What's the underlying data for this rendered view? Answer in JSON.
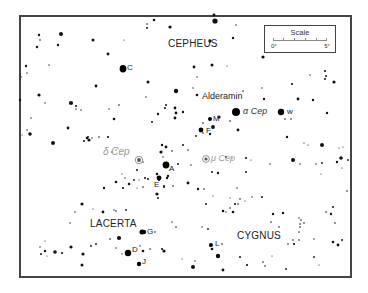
{
  "map": {
    "constellations": [
      {
        "name": "CEPHEUS",
        "x": 168,
        "y": 44
      },
      {
        "name": "LACERTA",
        "x": 90,
        "y": 224
      },
      {
        "name": "CYGNUS",
        "x": 237,
        "y": 236
      }
    ],
    "named_stars": [
      {
        "label": "Alderamin",
        "x": 202,
        "y": 97,
        "style": "plain"
      }
    ],
    "greek_labels": [
      {
        "label": "α Cep",
        "x": 243,
        "y": 107,
        "color": "#333333"
      },
      {
        "label": "δ Cep",
        "x": 103,
        "y": 148,
        "color": "#9a9a9a"
      },
      {
        "label": "μ Cep",
        "x": 210,
        "y": 153,
        "color": "#9a9a9a"
      }
    ],
    "star_letters": [
      {
        "label": "C",
        "x": 127,
        "y": 64
      },
      {
        "label": "w",
        "x": 288,
        "y": 109
      },
      {
        "label": "M",
        "x": 213,
        "y": 116
      },
      {
        "label": "F",
        "x": 207,
        "y": 127
      },
      {
        "label": "A",
        "x": 169,
        "y": 165
      },
      {
        "label": "E",
        "x": 154,
        "y": 181
      },
      {
        "label": "G",
        "x": 148,
        "y": 229
      },
      {
        "label": "D",
        "x": 132,
        "y": 246
      },
      {
        "label": "J",
        "x": 142,
        "y": 259
      },
      {
        "label": "L",
        "x": 215,
        "y": 241
      }
    ],
    "variable_stars": [
      {
        "name": "delta-cep",
        "x": 139,
        "y": 160,
        "r": 2.5,
        "color": "#888888"
      },
      {
        "name": "mu-cep",
        "x": 206,
        "y": 159,
        "r": 2.2,
        "color": "#888888"
      }
    ],
    "scale": {
      "title": "Scale",
      "start_label": "0°",
      "end_label": "5°"
    },
    "stars": [
      [
        214,
        15,
        1.4
      ],
      [
        215,
        21,
        2.6
      ],
      [
        39,
        35,
        1.2
      ],
      [
        40,
        40,
        0.8
      ],
      [
        61,
        34,
        2.0
      ],
      [
        37,
        47,
        1.2
      ],
      [
        93,
        40,
        1.5
      ],
      [
        58,
        45,
        1.2
      ],
      [
        147,
        24,
        0.8
      ],
      [
        147,
        28,
        1.0
      ],
      [
        154,
        20,
        1.3
      ],
      [
        170,
        27,
        1.6
      ],
      [
        108,
        54,
        1.4
      ],
      [
        124,
        40,
        0.6
      ],
      [
        123,
        68,
        3.0
      ],
      [
        26,
        66,
        1.2
      ],
      [
        49,
        65,
        0.7
      ],
      [
        27,
        73,
        0.7
      ],
      [
        21,
        77,
        0.7
      ],
      [
        20,
        100,
        1.2
      ],
      [
        148,
        82,
        1.5
      ],
      [
        96,
        86,
        1.4
      ],
      [
        176,
        91,
        2.2
      ],
      [
        197,
        95,
        1.3
      ],
      [
        193,
        88,
        0.7
      ],
      [
        39,
        95,
        1.6
      ],
      [
        45,
        103,
        0.7
      ],
      [
        71,
        103,
        2.1
      ],
      [
        76,
        106,
        1.0
      ],
      [
        76,
        109,
        0.7
      ],
      [
        81,
        110,
        0.7
      ],
      [
        109,
        109,
        0.7
      ],
      [
        119,
        105,
        0.8
      ],
      [
        114,
        119,
        1.3
      ],
      [
        146,
        97,
        0.7
      ],
      [
        152,
        122,
        1.0
      ],
      [
        158,
        114,
        1.2
      ],
      [
        165,
        108,
        1.0
      ],
      [
        166,
        105,
        1.0
      ],
      [
        175,
        108,
        1.4
      ],
      [
        176,
        113,
        1.4
      ],
      [
        175,
        118,
        1.4
      ],
      [
        183,
        112,
        1.2
      ],
      [
        31,
        118,
        0.7
      ],
      [
        27,
        130,
        0.7
      ],
      [
        30,
        134,
        1.8
      ],
      [
        68,
        128,
        1.4
      ],
      [
        87,
        138,
        1.3
      ],
      [
        88,
        137,
        1.0
      ],
      [
        99,
        137,
        0.8
      ],
      [
        108,
        137,
        1.1
      ],
      [
        53,
        143,
        2.0
      ],
      [
        84,
        141,
        1.0
      ],
      [
        89,
        140,
        1.6
      ],
      [
        92,
        138,
        0.7
      ],
      [
        22,
        135,
        0.6
      ],
      [
        236,
        25,
        0.7
      ],
      [
        210,
        41,
        1.6
      ],
      [
        233,
        38,
        1.2
      ],
      [
        227,
        66,
        0.6
      ],
      [
        212,
        65,
        1.5
      ],
      [
        194,
        67,
        1.4
      ],
      [
        197,
        77,
        0.7
      ],
      [
        263,
        57,
        1.6
      ],
      [
        262,
        88,
        0.7
      ],
      [
        243,
        91,
        0.8
      ],
      [
        264,
        99,
        1.2
      ],
      [
        334,
        82,
        1.6
      ],
      [
        325,
        71,
        1.1
      ],
      [
        325,
        79,
        1.0
      ],
      [
        326,
        76,
        1.0
      ],
      [
        310,
        75,
        0.7
      ],
      [
        298,
        99,
        1.4
      ],
      [
        292,
        84,
        1.1
      ],
      [
        313,
        100,
        1.2
      ],
      [
        327,
        113,
        1.2
      ],
      [
        285,
        119,
        0.8
      ],
      [
        291,
        119,
        0.8
      ],
      [
        238,
        130,
        1.4
      ],
      [
        230,
        121,
        0.8
      ],
      [
        219,
        117,
        1.6
      ],
      [
        213,
        127,
        1.9
      ],
      [
        210,
        134,
        1.2
      ],
      [
        203,
        133,
        0.8
      ],
      [
        196,
        136,
        0.9
      ],
      [
        203,
        123,
        0.8
      ],
      [
        322,
        145,
        2.0
      ],
      [
        341,
        158,
        1.8
      ],
      [
        337,
        162,
        1.2
      ],
      [
        293,
        160,
        2.0
      ],
      [
        300,
        164,
        0.7
      ],
      [
        316,
        164,
        0.7
      ],
      [
        322,
        163,
        0.9
      ],
      [
        270,
        164,
        0.7
      ],
      [
        246,
        172,
        1.0
      ],
      [
        218,
        173,
        1.2
      ],
      [
        237,
        188,
        0.7
      ],
      [
        198,
        189,
        1.2
      ],
      [
        188,
        183,
        1.4
      ],
      [
        188,
        150,
        0.8
      ],
      [
        183,
        145,
        1.0
      ],
      [
        212,
        172,
        1.0
      ],
      [
        161,
        152,
        1.6
      ],
      [
        166,
        147,
        1.4
      ],
      [
        163,
        157,
        0.7
      ],
      [
        162,
        145,
        1.2
      ],
      [
        178,
        164,
        1.0
      ],
      [
        168,
        176,
        1.2
      ],
      [
        167,
        178,
        1.2
      ],
      [
        159,
        180,
        1.1
      ],
      [
        157,
        174,
        1.3
      ],
      [
        164,
        187,
        1.0
      ],
      [
        164,
        186,
        1.0
      ],
      [
        145,
        178,
        1.0
      ],
      [
        148,
        179,
        1.0
      ],
      [
        137,
        170,
        1.0
      ],
      [
        125,
        178,
        0.7
      ],
      [
        129,
        184,
        1.3
      ],
      [
        123,
        188,
        1.1
      ],
      [
        116,
        182,
        1.3
      ],
      [
        134,
        180,
        0.9
      ],
      [
        143,
        187,
        0.8
      ],
      [
        157,
        194,
        1.6
      ],
      [
        104,
        188,
        1.2
      ],
      [
        82,
        204,
        1.6
      ],
      [
        75,
        212,
        0.7
      ],
      [
        70,
        223,
        0.7
      ],
      [
        114,
        210,
        0.7
      ],
      [
        116,
        211,
        0.8
      ],
      [
        126,
        210,
        0.9
      ],
      [
        103,
        212,
        1.4
      ],
      [
        144,
        232,
        2.2
      ],
      [
        119,
        238,
        2.1
      ],
      [
        140,
        246,
        0.7
      ],
      [
        162,
        249,
        1.1
      ],
      [
        126,
        252,
        0.8
      ],
      [
        155,
        232,
        0.8
      ],
      [
        172,
        222,
        0.7
      ],
      [
        176,
        227,
        0.8
      ],
      [
        202,
        227,
        0.7
      ],
      [
        208,
        229,
        0.9
      ],
      [
        218,
        256,
        2.2
      ],
      [
        212,
        249,
        1.3
      ],
      [
        210,
        246,
        0.8
      ],
      [
        222,
        244,
        0.8
      ],
      [
        206,
        204,
        1.0
      ],
      [
        223,
        211,
        1.3
      ],
      [
        226,
        212,
        0.7
      ],
      [
        230,
        208,
        0.8
      ],
      [
        233,
        212,
        1.3
      ],
      [
        235,
        204,
        1.0
      ],
      [
        238,
        204,
        0.8
      ],
      [
        240,
        199,
        0.8
      ],
      [
        252,
        197,
        0.7
      ],
      [
        262,
        197,
        1.0
      ],
      [
        273,
        214,
        1.2
      ],
      [
        283,
        213,
        1.2
      ],
      [
        299,
        218,
        0.7
      ],
      [
        300,
        227,
        0.8
      ],
      [
        300,
        224,
        0.8
      ],
      [
        299,
        232,
        0.8
      ],
      [
        326,
        212,
        0.8
      ],
      [
        331,
        214,
        1.2
      ],
      [
        333,
        207,
        1.0
      ],
      [
        347,
        191,
        0.8
      ],
      [
        335,
        223,
        0.8
      ],
      [
        333,
        242,
        1.3
      ],
      [
        338,
        245,
        1.4
      ],
      [
        342,
        240,
        1.0
      ],
      [
        314,
        239,
        0.7
      ],
      [
        294,
        244,
        1.1
      ],
      [
        293,
        240,
        0.8
      ],
      [
        288,
        244,
        0.8
      ],
      [
        299,
        240,
        0.8
      ],
      [
        314,
        257,
        0.9
      ],
      [
        240,
        257,
        1.0
      ],
      [
        247,
        265,
        1.1
      ],
      [
        263,
        262,
        0.8
      ],
      [
        265,
        266,
        0.8
      ],
      [
        286,
        269,
        0.9
      ],
      [
        193,
        267,
        2.0
      ],
      [
        195,
        261,
        0.7
      ],
      [
        182,
        259,
        0.6
      ],
      [
        223,
        270,
        1.4
      ],
      [
        272,
        256,
        0.6
      ],
      [
        40,
        247,
        0.7
      ],
      [
        41,
        254,
        1.0
      ],
      [
        45,
        251,
        1.2
      ],
      [
        47,
        256,
        0.6
      ],
      [
        55,
        252,
        1.8
      ],
      [
        62,
        253,
        1.1
      ],
      [
        71,
        247,
        1.6
      ],
      [
        83,
        254,
        1.6
      ],
      [
        91,
        246,
        0.9
      ],
      [
        96,
        244,
        0.9
      ],
      [
        82,
        265,
        1.5
      ],
      [
        122,
        254,
        0.7
      ],
      [
        126,
        253,
        0.7
      ],
      [
        143,
        251,
        1.3
      ],
      [
        150,
        249,
        0.8
      ],
      [
        116,
        248,
        0.7
      ],
      [
        45,
        241,
        0.6
      ],
      [
        129,
        253,
        0.7
      ],
      [
        110,
        239,
        0.8
      ],
      [
        164,
        251,
        1.6
      ],
      [
        93,
        209,
        0.6
      ],
      [
        143,
        162,
        0.7
      ],
      [
        112,
        152,
        0.8
      ],
      [
        116,
        150,
        0.6
      ],
      [
        172,
        151,
        0.8
      ],
      [
        122,
        174,
        0.6
      ],
      [
        158,
        198,
        1.0
      ],
      [
        173,
        186,
        0.8
      ],
      [
        139,
        180,
        0.6
      ],
      [
        137,
        188,
        0.6
      ],
      [
        191,
        165,
        0.7
      ],
      [
        204,
        189,
        0.8
      ],
      [
        213,
        196,
        0.6
      ],
      [
        230,
        198,
        0.6
      ],
      [
        245,
        201,
        0.6
      ],
      [
        271,
        222,
        0.8
      ],
      [
        279,
        227,
        0.8
      ],
      [
        301,
        220,
        0.8
      ],
      [
        304,
        223,
        0.8
      ],
      [
        319,
        265,
        0.6
      ],
      [
        342,
        168,
        0.6
      ],
      [
        348,
        160,
        0.9
      ],
      [
        304,
        143,
        0.6
      ],
      [
        308,
        145,
        0.6
      ],
      [
        287,
        137,
        1.2
      ],
      [
        321,
        174,
        0.6
      ],
      [
        339,
        148,
        0.6
      ],
      [
        343,
        147,
        0.6
      ],
      [
        251,
        160,
        0.6
      ],
      [
        226,
        157,
        0.9
      ],
      [
        246,
        158,
        1.1
      ],
      [
        232,
        158,
        0.6
      ]
    ],
    "bright_stars": [
      {
        "name": "alderamin",
        "x": 236,
        "y": 112,
        "r": 4.0
      },
      {
        "name": "w-cep",
        "x": 281,
        "y": 112,
        "r": 3.2
      },
      {
        "name": "c-star",
        "x": 123,
        "y": 69,
        "r": 3.4
      },
      {
        "name": "a-star",
        "x": 166,
        "y": 165,
        "r": 3.4
      },
      {
        "name": "e-star",
        "x": 159,
        "y": 178,
        "r": 2.4
      },
      {
        "name": "m-star",
        "x": 210,
        "y": 119,
        "r": 2.0
      },
      {
        "name": "f-star",
        "x": 201,
        "y": 130,
        "r": 2.4
      },
      {
        "name": "g-star",
        "x": 142,
        "y": 232,
        "r": 2.5
      },
      {
        "name": "d-star",
        "x": 128,
        "y": 253,
        "r": 3.2
      },
      {
        "name": "j-star",
        "x": 139,
        "y": 264,
        "r": 2.2
      },
      {
        "name": "l-star",
        "x": 211,
        "y": 245,
        "r": 2.0
      }
    ]
  }
}
